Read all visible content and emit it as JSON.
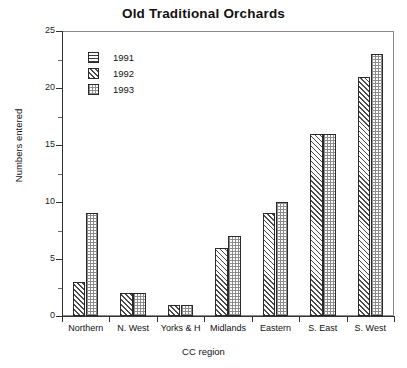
{
  "chart_data": {
    "type": "bar",
    "title": "Old Traditional Orchards",
    "xlabel": "CC region",
    "ylabel": "Numbers entered",
    "categories": [
      "Northern",
      "N. West",
      "Yorks & H",
      "Midlands",
      "Eastern",
      "S. East",
      "S. West"
    ],
    "series": [
      {
        "name": "1991",
        "pattern": "horizontal-lines",
        "values": [
          0,
          0,
          0,
          0,
          0,
          0,
          0
        ]
      },
      {
        "name": "1992",
        "pattern": "diagonal-hatch",
        "values": [
          3,
          2,
          1,
          6,
          9,
          16,
          21
        ]
      },
      {
        "name": "1993",
        "pattern": "cross-grid",
        "values": [
          9,
          2,
          1,
          7,
          10,
          16,
          23
        ]
      }
    ],
    "ylim": [
      0,
      25
    ],
    "ytick_labels": [
      "0",
      "5",
      "10",
      "15",
      "20",
      "25"
    ],
    "ytick_values": [
      0,
      5,
      10,
      15,
      20,
      25
    ],
    "yminor_values": [
      2.5,
      7.5,
      12.5,
      17.5,
      22.5
    ],
    "grid": false,
    "legend_position": "top-left",
    "legend_entries": [
      "1991",
      "1992",
      "1993"
    ]
  },
  "colors": {
    "background": "#ffffff",
    "axis": "#333333",
    "frame": "#8a8a8a",
    "text": "#111111",
    "bar_outline": "#2a2a2a"
  }
}
